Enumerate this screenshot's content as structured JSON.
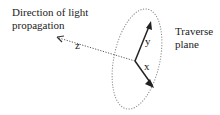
{
  "diagram": {
    "labels": {
      "direction_line1": "Direction of light",
      "direction_line2": "propagation",
      "plane_line1": "Traverse",
      "plane_line2": "plane",
      "z": "z",
      "y": "y",
      "x": "x"
    },
    "colors": {
      "axis": "#222222",
      "dotted": "#777777"
    }
  }
}
